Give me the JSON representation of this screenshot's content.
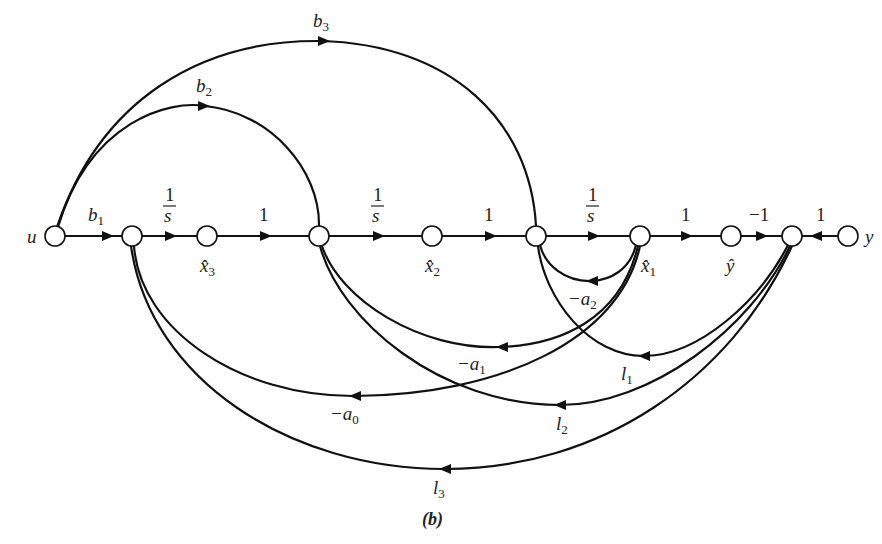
{
  "figure": {
    "caption": "(b)",
    "type": "signal-flow-graph"
  },
  "nodes": [
    {
      "id": "u",
      "label": "u",
      "x": 55,
      "y": 236
    },
    {
      "id": "n1",
      "label": "",
      "x": 132,
      "y": 236
    },
    {
      "id": "x3",
      "label": "x̂3",
      "x": 207,
      "y": 236
    },
    {
      "id": "n2",
      "label": "",
      "x": 319,
      "y": 236
    },
    {
      "id": "x2",
      "label": "x̂2",
      "x": 432,
      "y": 236
    },
    {
      "id": "n3",
      "label": "",
      "x": 536,
      "y": 236
    },
    {
      "id": "x1",
      "label": "x̂1",
      "x": 640,
      "y": 236
    },
    {
      "id": "yhat",
      "label": "ŷ",
      "x": 731,
      "y": 236
    },
    {
      "id": "n4",
      "label": "",
      "x": 792,
      "y": 236
    },
    {
      "id": "y",
      "label": "y",
      "x": 848,
      "y": 236
    }
  ],
  "labels": {
    "u": "u",
    "y": "y",
    "x3": {
      "base": "x̂",
      "sub": "3"
    },
    "x2": {
      "base": "x̂",
      "sub": "2"
    },
    "x1": {
      "base": "x̂",
      "sub": "1"
    },
    "yhat": "ŷ"
  },
  "edges": {
    "b1": {
      "from": "u",
      "to": "n1",
      "base": "b",
      "sub": "1"
    },
    "s1": {
      "from": "n1",
      "to": "x3",
      "num": "1",
      "den": "s"
    },
    "one1": {
      "from": "x3",
      "to": "n2",
      "gain": "1"
    },
    "s2": {
      "from": "n2",
      "to": "x2",
      "num": "1",
      "den": "s"
    },
    "one2": {
      "from": "x2",
      "to": "n3",
      "gain": "1"
    },
    "s3": {
      "from": "n3",
      "to": "x1",
      "num": "1",
      "den": "s"
    },
    "one3": {
      "from": "x1",
      "to": "yhat",
      "gain": "1"
    },
    "minus1": {
      "from": "yhat",
      "to": "n4",
      "gain": "−1"
    },
    "one4": {
      "from": "y",
      "to": "n4",
      "gain": "1"
    },
    "b2": {
      "from": "u",
      "to": "n2",
      "base": "b",
      "sub": "2"
    },
    "b3": {
      "from": "u",
      "to": "n3",
      "base": "b",
      "sub": "3"
    },
    "a2": {
      "from": "x1",
      "to": "n3",
      "base": "−a",
      "sub": "2"
    },
    "a1": {
      "from": "x1",
      "to": "n2",
      "base": "−a",
      "sub": "1"
    },
    "a0": {
      "from": "x1",
      "to": "n1",
      "base": "−a",
      "sub": "0"
    },
    "l1": {
      "from": "n4",
      "to": "n3",
      "base": "l",
      "sub": "1"
    },
    "l2": {
      "from": "n4",
      "to": "n2",
      "base": "l",
      "sub": "2"
    },
    "l3": {
      "from": "n4",
      "to": "n1",
      "base": "l",
      "sub": "3"
    }
  }
}
